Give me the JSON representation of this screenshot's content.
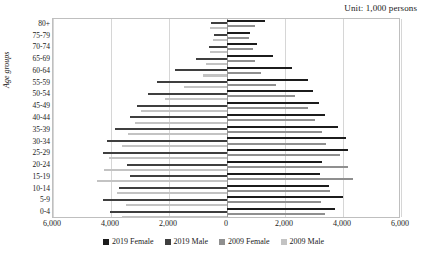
{
  "unit_note": "Unit: 1,000 persons",
  "axis": {
    "ylabel": "Age groups",
    "xticks": [
      "6,000",
      "4,000",
      "2,000",
      "0",
      "2,000",
      "4,000",
      "6,000"
    ],
    "xtick_values": [
      -6000,
      -4000,
      -2000,
      0,
      2000,
      4000,
      6000
    ],
    "xlim": [
      -6000,
      6000
    ]
  },
  "legend": {
    "items": [
      {
        "label": "2019 Female",
        "color": "#1c1c1c",
        "key": "f2019"
      },
      {
        "label": "2019 Male",
        "color": "#3f3f3f",
        "key": "m2019"
      },
      {
        "label": "2009 Female",
        "color": "#8f8f8f",
        "key": "f2009"
      },
      {
        "label": "2009 Male",
        "color": "#c3c3c3",
        "key": "m2009"
      }
    ]
  },
  "chart_data": {
    "type": "bar",
    "subtype": "population-pyramid",
    "title": "",
    "xlabel": "",
    "ylabel": "Age groups",
    "unit": "1,000 persons",
    "xlim": [
      -6000,
      6000
    ],
    "xticks": [
      -6000,
      -4000,
      -2000,
      0,
      2000,
      4000,
      6000
    ],
    "xticklabels": [
      "6,000",
      "4,000",
      "2,000",
      "0",
      "2,000",
      "4,000",
      "6,000"
    ],
    "grid": true,
    "legend_position": "bottom",
    "orientation": "horizontal",
    "categories": [
      "80+",
      "75-79",
      "70-74",
      "65-69",
      "60-64",
      "55-59",
      "50-54",
      "45-49",
      "40-44",
      "35-39",
      "30-34",
      "25-29",
      "20-24",
      "15-19",
      "10-14",
      "5-9",
      "0-4"
    ],
    "series": [
      {
        "name": "2019 Female",
        "color": "#1c1c1c",
        "side": "right",
        "values": [
          1300,
          800,
          1030,
          1580,
          2230,
          2780,
          2960,
          3170,
          3370,
          3830,
          4120,
          4170,
          3290,
          3200,
          3500,
          3990,
          3730
        ]
      },
      {
        "name": "2019 Male",
        "color": "#3f3f3f",
        "side": "left",
        "values": [
          560,
          450,
          620,
          1080,
          1790,
          2400,
          2720,
          3100,
          3330,
          3860,
          4150,
          4280,
          3460,
          3340,
          3710,
          4280,
          4020
        ]
      },
      {
        "name": "2009 Female",
        "color": "#8f8f8f",
        "side": "right",
        "values": [
          950,
          770,
          900,
          950,
          1160,
          1690,
          2350,
          2810,
          3040,
          3260,
          3420,
          3880,
          4180,
          4360,
          3540,
          3250,
          3380
        ]
      },
      {
        "name": "2009 Male",
        "color": "#c3c3c3",
        "side": "left",
        "values": [
          580,
          480,
          600,
          720,
          830,
          1500,
          2130,
          2950,
          3170,
          3400,
          3620,
          4080,
          4250,
          4500,
          3780,
          3480,
          3620
        ]
      }
    ]
  }
}
